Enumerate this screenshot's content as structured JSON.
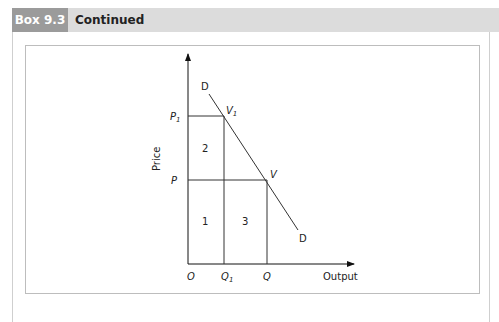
{
  "header": {
    "box_label": "Box 9.3",
    "title": "Continued"
  },
  "diagram": {
    "y_axis_label": "Price",
    "x_axis_label": "Output",
    "origin_label": "O",
    "price_levels": [
      {
        "label": "P",
        "subscript": "1"
      },
      {
        "label": "P",
        "subscript": ""
      }
    ],
    "quantity_levels": [
      {
        "label": "Q",
        "subscript": "1"
      },
      {
        "label": "Q",
        "subscript": ""
      }
    ],
    "curve_label_top": "D",
    "curve_label_bottom": "D",
    "points": [
      {
        "label": "V",
        "subscript": "1"
      },
      {
        "label": "V",
        "subscript": ""
      }
    ],
    "areas": [
      "1",
      "2",
      "3"
    ]
  }
}
